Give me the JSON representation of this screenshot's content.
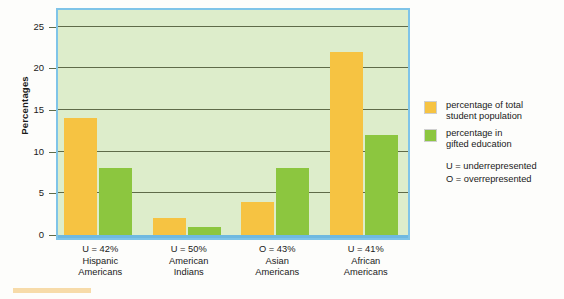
{
  "chart_data": {
    "type": "bar",
    "title": "",
    "xlabel": "",
    "ylabel": "Percentages",
    "ylim": [
      0,
      27
    ],
    "yticks": [
      0,
      5,
      10,
      15,
      20,
      25
    ],
    "grid": true,
    "legend_position": "right",
    "categories": [
      "Hispanic Americans",
      "American Indians",
      "Asian Americans",
      "African Americans"
    ],
    "category_labels": [
      {
        "pct": "U = 42%",
        "line1": "Hispanic",
        "line2": "Americans"
      },
      {
        "pct": "U = 50%",
        "line1": "American",
        "line2": "Indians"
      },
      {
        "pct": "O = 43%",
        "line1": "Asian",
        "line2": "Americans"
      },
      {
        "pct": "U = 41%",
        "line1": "African",
        "line2": "Americans"
      }
    ],
    "series": [
      {
        "name": "percentage of total student population",
        "color": "#f6c342",
        "values": [
          14,
          2,
          4,
          22
        ]
      },
      {
        "name": "percentage in gifted education",
        "color": "#8cc63f",
        "values": [
          8,
          1,
          8,
          12
        ]
      }
    ]
  },
  "legend": {
    "items": [
      {
        "line1": "percentage of total",
        "line2": "student population",
        "color": "#f6c342"
      },
      {
        "line1": "percentage in",
        "line2": "gifted education",
        "color": "#8cc63f"
      }
    ],
    "keys": [
      "U = underrepresented",
      "O = overrepresented"
    ]
  },
  "colors": {
    "plot_background": "#ddedcb",
    "plot_border": "#7fc4e8",
    "gridline": "#5f6b49",
    "baseline": "#6fb9e0",
    "orange": "#f6c342",
    "green": "#8cc63f"
  }
}
